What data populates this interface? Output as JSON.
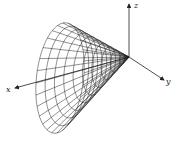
{
  "diagram": {
    "type": "3d-wireframe-cone",
    "axes": {
      "x": {
        "label": "x"
      },
      "y": {
        "label": "y"
      },
      "z": {
        "label": "z"
      }
    },
    "colors": {
      "line": "#222222",
      "background": "#ffffff"
    },
    "cone": {
      "apex": [
        129,
        57
      ],
      "base_center": [
        60,
        78
      ],
      "base_axis_a": [
        24,
        -5
      ],
      "base_axis_b": [
        -3,
        55
      ],
      "base_axis_c": [
        -22,
        8
      ],
      "rings": 10,
      "rulings": 28
    }
  }
}
